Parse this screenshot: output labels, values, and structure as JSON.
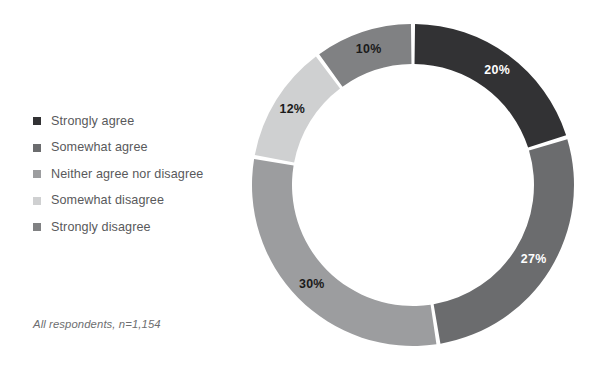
{
  "chart_data": {
    "type": "pie",
    "variant": "donut",
    "title": "",
    "subtitle": "",
    "xlabel": "",
    "ylabel": "",
    "legend_position": "left",
    "grid": false,
    "units": "percent",
    "start_angle_deg": 0,
    "direction": "clockwise",
    "categories": [
      "Strongly agree",
      "Somewhat agree",
      "Neither agree nor disagree",
      "Somewhat disagree",
      "Strongly disagree"
    ],
    "values": [
      20,
      27,
      30,
      12,
      10
    ],
    "data_labels": [
      "20%",
      "27%",
      "30%",
      "12%",
      "10%"
    ],
    "colors": [
      "#323234",
      "#6b6c6e",
      "#9c9d9f",
      "#cfd0d1",
      "#808183"
    ],
    "label_colors": [
      "#ffffff",
      "#ffffff",
      "#1a1a1a",
      "#1a1a1a",
      "#1a1a1a"
    ],
    "annotation": "All respondents, n=1,154"
  },
  "legend": {
    "items": [
      {
        "label": "Strongly agree",
        "color": "#323234"
      },
      {
        "label": "Somewhat agree",
        "color": "#6b6c6e"
      },
      {
        "label": "Neither agree nor disagree",
        "color": "#9c9d9f"
      },
      {
        "label": "Somewhat disagree",
        "color": "#cfd0d1"
      },
      {
        "label": "Strongly disagree",
        "color": "#808183"
      }
    ]
  },
  "footnote": {
    "text": "All respondents, n=1,154"
  }
}
